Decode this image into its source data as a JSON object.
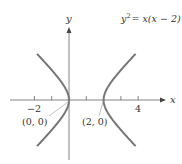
{
  "chart_data": {
    "type": "line",
    "title": "",
    "equation_label": "y² = x(x − 2)",
    "equation_parts": {
      "base": "y",
      "exp": "2",
      "rest": "= x(x − 2)"
    },
    "xlabel": "x",
    "ylabel": "y",
    "xlim": [
      -3.9,
      5.6
    ],
    "ylim": [
      -3.8,
      4.2
    ],
    "x_ticks": [
      -2,
      -1,
      0,
      1,
      2,
      3,
      4
    ],
    "x_tick_labels": [
      {
        "value": -2,
        "label": "−2"
      },
      {
        "value": 4,
        "label": "4"
      }
    ],
    "annotations": [
      {
        "point": [
          0,
          0
        ],
        "label": "(0, 0)"
      },
      {
        "point": [
          2,
          0
        ],
        "label": "(2, 0)"
      }
    ],
    "series": [
      {
        "name": "left branch",
        "x_range": [
          -2,
          0
        ],
        "description": "x <= 0 branch of y^2 = x(x-2)"
      },
      {
        "name": "right branch",
        "x_range": [
          2,
          4
        ],
        "description": "x >= 2 branch of y^2 = x(x-2)"
      }
    ],
    "grid": false,
    "colors": {
      "curve": "#777777",
      "axis": "#555555",
      "text": "#333333"
    }
  },
  "labels": {
    "x_axis": "x",
    "y_axis": "y",
    "tick_neg2": "−2",
    "tick_4": "4",
    "origin_point": "(0, 0)",
    "vertex_point": "(2, 0)",
    "eq_base": "y",
    "eq_exp": "2",
    "eq_rest": "= x(x − 2)"
  }
}
